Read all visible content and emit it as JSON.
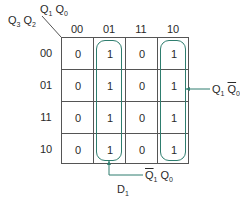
{
  "title": "D1",
  "axis": {
    "col_var": {
      "a": "Q",
      "a_sub": "1",
      "b": "Q",
      "b_sub": "0"
    },
    "row_var": {
      "a": "Q",
      "a_sub": "3",
      "b": "Q",
      "b_sub": "2"
    }
  },
  "columns": [
    "00",
    "01",
    "11",
    "10"
  ],
  "rows": [
    "00",
    "01",
    "11",
    "10"
  ],
  "cells": [
    [
      "0",
      "1",
      "0",
      "1"
    ],
    [
      "0",
      "1",
      "0",
      "1"
    ],
    [
      "0",
      "1",
      "0",
      "1"
    ],
    [
      "0",
      "1",
      "0",
      "1"
    ]
  ],
  "groups": [
    {
      "term": "Q̄1 Q0",
      "label_a": "Q",
      "label_a_sub": "1",
      "label_a_bar": true,
      "label_b": "Q",
      "label_b_sub": "0",
      "label_b_bar": false,
      "column": "01"
    },
    {
      "term": "Q1 Q̄0",
      "label_a": "Q",
      "label_a_sub": "1",
      "label_a_bar": false,
      "label_b": "Q",
      "label_b_sub": "0",
      "label_b_bar": true,
      "column": "10"
    }
  ],
  "colors": {
    "loop": "#2e7d6e",
    "grid": "#555555",
    "text": "#2a2a2a"
  }
}
